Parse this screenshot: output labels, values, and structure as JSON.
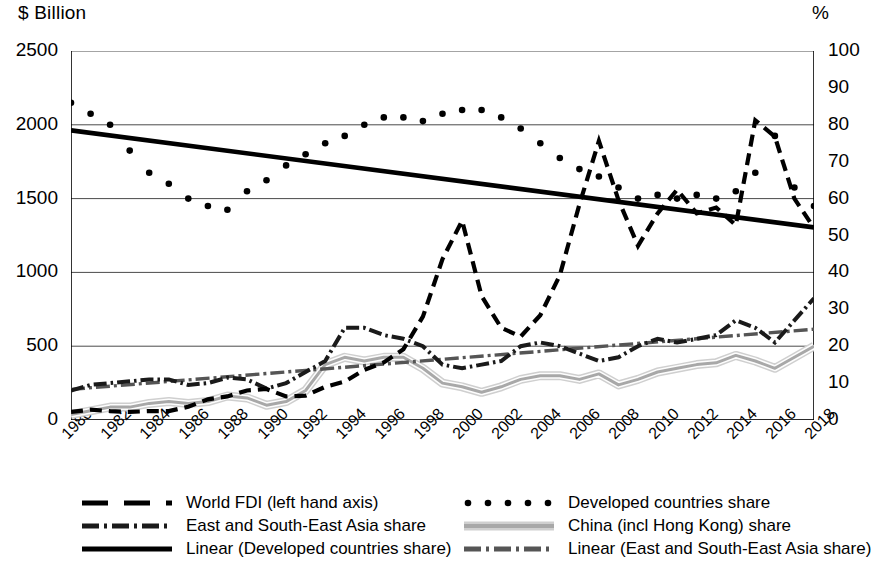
{
  "axes": {
    "left_unit": "$ Billion",
    "right_unit": "%",
    "left_ticks": [
      "2500",
      "2000",
      "1500",
      "1000",
      "500",
      "0"
    ],
    "right_ticks": [
      "100",
      "90",
      "80",
      "70",
      "60",
      "50",
      "40",
      "30",
      "20",
      "10",
      "0"
    ],
    "x_ticks": [
      "1980",
      "1982",
      "1984",
      "1986",
      "1988",
      "1990",
      "1992",
      "1994",
      "1996",
      "1998",
      "2000",
      "2002",
      "2004",
      "2006",
      "2008",
      "2010",
      "2012",
      "2014",
      "2016",
      "2018"
    ]
  },
  "legend": {
    "items": [
      {
        "label": "World FDI (left hand axis)",
        "key": "dashed-black",
        "color": "#000000"
      },
      {
        "label": "East and South-East Asia share",
        "key": "dashdot-black",
        "color": "#1a1a1a"
      },
      {
        "label": "Linear (Developed countries share)",
        "key": "solid-black",
        "color": "#000000"
      },
      {
        "label": "Developed countries share",
        "key": "dotted-black",
        "color": "#000000"
      },
      {
        "label": "China (incl Hong Kong) share",
        "key": "solid-grey",
        "color": "#a8a8a8"
      },
      {
        "label": "Linear (East and South-East Asia share)",
        "key": "dashdot-grey",
        "color": "#555555"
      }
    ]
  },
  "chart_data": {
    "type": "line",
    "title": "",
    "xlabel": "",
    "ylabel": "$ Billion",
    "y2label": "%",
    "ylim": [
      0,
      2500
    ],
    "y2lim": [
      0,
      100
    ],
    "grid": true,
    "legend_position": "bottom",
    "x": [
      1980,
      1981,
      1982,
      1983,
      1984,
      1985,
      1986,
      1987,
      1988,
      1989,
      1990,
      1991,
      1992,
      1993,
      1994,
      1995,
      1996,
      1997,
      1998,
      1999,
      2000,
      2001,
      2002,
      2003,
      2004,
      2005,
      2006,
      2007,
      2008,
      2009,
      2010,
      2011,
      2012,
      2013,
      2014,
      2015,
      2016,
      2017,
      2018
    ],
    "series": [
      {
        "name": "World FDI (left hand axis)",
        "axis": "left",
        "unit": "$ Billion",
        "style": "dashed",
        "color": "#000000",
        "values": [
          55,
          70,
          60,
          55,
          60,
          60,
          90,
          140,
          160,
          200,
          210,
          160,
          165,
          225,
          260,
          340,
          390,
          480,
          700,
          1090,
          1350,
          840,
          625,
          565,
          710,
          980,
          1460,
          1890,
          1490,
          1180,
          1400,
          1560,
          1400,
          1440,
          1320,
          2030,
          1920,
          1500,
          1300
        ]
      },
      {
        "name": "Developed countries share",
        "axis": "right",
        "unit": "%",
        "style": "dotted",
        "color": "#000000",
        "values": [
          86,
          83,
          80,
          73,
          67,
          64,
          60,
          58,
          57,
          62,
          65,
          69,
          72,
          75,
          77,
          80,
          82,
          82,
          81,
          83,
          84,
          84,
          82,
          79,
          75,
          71,
          68,
          66,
          63,
          60,
          61,
          60,
          61,
          60,
          62,
          67,
          77,
          63,
          58
        ],
        "values_left_scale": [
          2150,
          2075,
          2000,
          1825,
          1675,
          1600,
          1500,
          1450,
          1425,
          1550,
          1625,
          1725,
          1800,
          1875,
          1925,
          2000,
          2050,
          2050,
          2025,
          2075,
          2100,
          2100,
          2050,
          1975,
          1875,
          1775,
          1700,
          1650,
          1575,
          1500,
          1525,
          1500,
          1525,
          1500,
          1550,
          1675,
          1925,
          1575,
          1450
        ]
      },
      {
        "name": "East and South-East Asia share",
        "axis": "right",
        "unit": "%",
        "style": "dashdot",
        "color": "#1a1a1a",
        "values": [
          8,
          9.5,
          10,
          10.5,
          11,
          11,
          9.5,
          10,
          11.5,
          11,
          8.5,
          10,
          13,
          16,
          25,
          25,
          23,
          22,
          20,
          15,
          14,
          15,
          16,
          20,
          21,
          20,
          18,
          16,
          17,
          20,
          22,
          21,
          22,
          23,
          27,
          25,
          21,
          27,
          33
        ]
      },
      {
        "name": "China (incl Hong Kong) share",
        "axis": "right",
        "unit": "%",
        "style": "solid-band",
        "color": "#a8a8a8",
        "values": [
          1.5,
          2.5,
          3.5,
          3.5,
          4.5,
          5,
          4.5,
          5,
          6.5,
          6,
          4,
          5,
          8,
          15,
          17,
          16,
          17,
          17,
          14,
          10,
          9,
          7.5,
          9,
          11,
          12,
          12,
          11,
          12.5,
          9.5,
          11,
          13,
          14,
          15,
          15.5,
          17.5,
          16,
          14,
          17,
          20
        ]
      },
      {
        "name": "Linear (Developed countries share)",
        "axis": "right",
        "unit": "%",
        "style": "trend-solid",
        "color": "#000000",
        "endpoints": [
          {
            "x": 1980,
            "y": 78.5
          },
          {
            "x": 2018,
            "y": 52.2
          }
        ],
        "endpoints_left_scale": [
          {
            "x": 1980,
            "y": 1963
          },
          {
            "x": 2018,
            "y": 1305
          }
        ]
      },
      {
        "name": "Linear (East and South-East Asia share)",
        "axis": "right",
        "unit": "%",
        "style": "trend-dashdot",
        "color": "#555555",
        "endpoints": [
          {
            "x": 1980,
            "y": 8.3
          },
          {
            "x": 2018,
            "y": 24.6
          }
        ],
        "endpoints_left_scale": [
          {
            "x": 1980,
            "y": 208
          },
          {
            "x": 2018,
            "y": 615
          }
        ]
      }
    ]
  }
}
